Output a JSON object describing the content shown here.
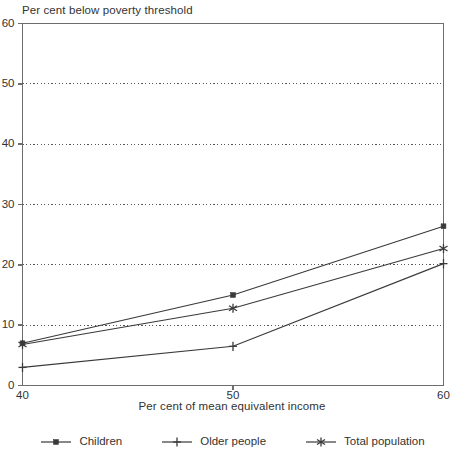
{
  "chart_data": {
    "type": "line",
    "title": "",
    "ylabel": "Per cent below poverty threshold",
    "xlabel": "Per cent of mean equivalent income",
    "x": [
      40,
      50,
      60
    ],
    "xticks": [
      "40",
      "50",
      "60"
    ],
    "yticks": [
      "0",
      "10",
      "20",
      "30",
      "40",
      "50",
      "60"
    ],
    "xlim": [
      40,
      60
    ],
    "ylim": [
      0,
      60
    ],
    "grid": "horizontal-dotted",
    "legend_position": "bottom",
    "series": [
      {
        "name": "Children",
        "marker": "square",
        "color": "#3a3a3a",
        "values": [
          7.0,
          15.0,
          26.4
        ]
      },
      {
        "name": "Older people",
        "marker": "plus",
        "color": "#3a3a3a",
        "values": [
          3.0,
          6.5,
          20.2
        ]
      },
      {
        "name": "Total population",
        "marker": "asterisk",
        "color": "#3a3a3a",
        "values": [
          6.8,
          12.8,
          22.7
        ]
      }
    ]
  },
  "legend": {
    "items": [
      {
        "label": "Children",
        "marker": "square-marker-icon"
      },
      {
        "label": "Older people",
        "marker": "plus-marker-icon"
      },
      {
        "label": "Total population",
        "marker": "asterisk-marker-icon"
      }
    ]
  },
  "style": {
    "axis_color": "#6d6d6d",
    "grid_color": "#555555",
    "line_color": "#3a3a3a",
    "text_color": "#333333",
    "background": "#ffffff"
  }
}
